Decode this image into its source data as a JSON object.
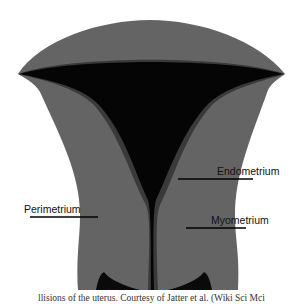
{
  "diagram": {
    "colors": {
      "perimetrium": "#5f5f5f",
      "myometrium": "#6b6b6b",
      "endometrium_band": "#3a3a3a",
      "cavity": "#050505",
      "background": "#ffffff"
    },
    "labels": [
      {
        "id": "endometrium",
        "text": "Endometrium"
      },
      {
        "id": "perimetrium",
        "text": "Perimetrium"
      },
      {
        "id": "myometrium",
        "text": "Myometrium"
      }
    ],
    "caption": "llisions of the uterus. Courtesy of Jatter et al. (Wiki Sci Mci"
  }
}
